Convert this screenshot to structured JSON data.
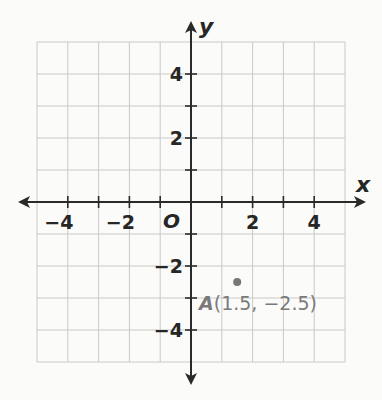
{
  "chart_data": {
    "type": "scatter",
    "title": "",
    "xlabel": "x",
    "ylabel": "y",
    "xlim": [
      -5,
      5
    ],
    "ylim": [
      -5,
      5
    ],
    "grid": true,
    "origin_label": "O",
    "x_tick_labels": [
      "−4",
      "−2",
      "2",
      "4"
    ],
    "x_tick_values": [
      -4,
      -2,
      2,
      4
    ],
    "y_tick_labels": [
      "4",
      "2",
      "−2",
      "−4"
    ],
    "y_tick_values": [
      4,
      2,
      -2,
      -4
    ],
    "points": [
      {
        "name": "A",
        "x": 1.5,
        "y": -2.5,
        "label": "A",
        "coords_text": "(1.5, −2.5)",
        "color": "#777777"
      }
    ]
  },
  "colors": {
    "grid": "#c9c9c9",
    "axis": "#2a2a2a",
    "point": "#777777",
    "background": "#fbfbf9"
  }
}
